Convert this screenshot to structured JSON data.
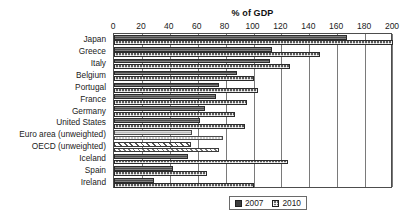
{
  "chart_data": {
    "type": "bar",
    "orientation": "horizontal",
    "title": "% of GDP",
    "xlabel": "% of GDP",
    "ylabel": "",
    "xlim": [
      0,
      200
    ],
    "xticks": [
      0,
      20,
      40,
      60,
      80,
      100,
      120,
      140,
      160,
      180,
      200
    ],
    "grid": true,
    "grid_axis": "x",
    "legend_position": "bottom-right",
    "categories": [
      "Japan",
      "Greece",
      "Italy",
      "Belgium",
      "Portugal",
      "France",
      "Germany",
      "United States",
      "Euro area (unweighted)",
      "OECD (unweighted)",
      "Iceland",
      "Spain",
      "Ireland"
    ],
    "series": [
      {
        "name": "2007",
        "color": "#4a4a4a",
        "values": [
          167,
          113,
          112,
          88,
          75,
          73,
          65,
          62,
          56,
          55,
          53,
          42,
          29
        ]
      },
      {
        "name": "2010",
        "color": "#6a6a6a",
        "values": [
          200,
          148,
          126,
          100,
          103,
          95,
          87,
          94,
          78,
          75,
          125,
          67,
          100
        ]
      }
    ]
  },
  "legend": {
    "items": [
      {
        "label": "2007"
      },
      {
        "label": "2010"
      }
    ]
  },
  "axis": {
    "title": "% of GDP"
  }
}
